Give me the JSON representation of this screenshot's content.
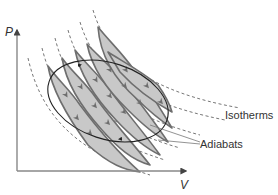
{
  "diagram": {
    "type": "PV diagram (Carnot-like cycle decomposed into small cycles)",
    "axes": {
      "y_label": "P",
      "x_label": "V"
    },
    "annotations": {
      "isotherms": "Isotherms",
      "adiabats": "Adiabats"
    },
    "colors": {
      "fill": "#c8c8c8",
      "stroke": "#6e6e6e",
      "cycle": "#222222",
      "axis": "#888888",
      "text": "#333333"
    }
  }
}
